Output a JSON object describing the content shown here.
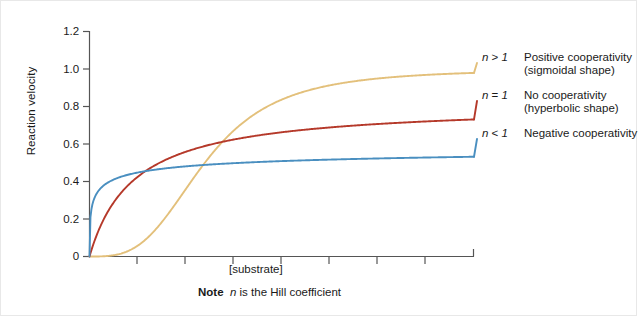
{
  "chart_data": {
    "type": "line",
    "title": "",
    "xlabel": "[substrate]",
    "ylabel": "Reaction velocity",
    "ylim": [
      0,
      1.2
    ],
    "xlim": [
      0,
      1
    ],
    "yticks": [
      "0",
      "0.2",
      "0.4",
      "0.6",
      "0.8",
      "1.0",
      "1.2"
    ],
    "ytick_values": [
      0,
      0.2,
      0.4,
      0.6,
      0.8,
      1.0,
      1.2
    ],
    "xticks": [
      "",
      "",
      "",
      "",
      "",
      "",
      "",
      ""
    ],
    "grid": false,
    "legend_position": "right-inline-annotations",
    "note": "Note n is the Hill coefficient",
    "note_bold": "Note",
    "note_italic": "n",
    "note_rest": " is the Hill coefficient",
    "series": [
      {
        "name": "n > 1",
        "label": "Positive cooperativity",
        "sublabel": "(sigmoidal shape)",
        "color": "#e3c07b",
        "vmax": 1.0,
        "hill_n": 3.2,
        "k_half": 0.3,
        "x": [
          0.0,
          0.05,
          0.1,
          0.15,
          0.2,
          0.25,
          0.3,
          0.35,
          0.4,
          0.45,
          0.5,
          0.55,
          0.6,
          0.65,
          0.7,
          0.75,
          0.8,
          0.85,
          0.9,
          0.95,
          1.0
        ],
        "y": [
          0.0,
          0.005,
          0.035,
          0.104,
          0.216,
          0.36,
          0.5,
          0.625,
          0.722,
          0.793,
          0.845,
          0.882,
          0.909,
          0.928,
          0.943,
          0.954,
          0.962,
          0.969,
          0.974,
          0.978,
          0.981
        ]
      },
      {
        "name": "n = 1",
        "label": "No cooperativity",
        "sublabel": "(hyperbolic shape)",
        "color": "#b5392a",
        "vmax": 0.815,
        "hill_n": 1.0,
        "k_half": 0.115,
        "x": [
          0.0,
          0.05,
          0.1,
          0.15,
          0.2,
          0.25,
          0.3,
          0.35,
          0.4,
          0.45,
          0.5,
          0.55,
          0.6,
          0.65,
          0.7,
          0.75,
          0.8,
          0.85,
          0.9,
          0.95,
          1.0
        ],
        "y": [
          0.0,
          0.247,
          0.379,
          0.46,
          0.517,
          0.558,
          0.589,
          0.614,
          0.633,
          0.649,
          0.663,
          0.674,
          0.684,
          0.692,
          0.7,
          0.706,
          0.712,
          0.717,
          0.722,
          0.726,
          0.73
        ]
      },
      {
        "name": "n < 1",
        "label": "Negative cooperativity",
        "sublabel": "",
        "color": "#4a8fc0",
        "vmax": 0.615,
        "hill_n": 0.42,
        "k_half": 0.012,
        "x": [
          0.0,
          0.05,
          0.1,
          0.15,
          0.2,
          0.25,
          0.3,
          0.35,
          0.4,
          0.45,
          0.5,
          0.55,
          0.6,
          0.65,
          0.7,
          0.75,
          0.8,
          0.85,
          0.9,
          0.95,
          1.0
        ],
        "y": [
          0.0,
          0.428,
          0.462,
          0.481,
          0.494,
          0.504,
          0.512,
          0.518,
          0.524,
          0.529,
          0.533,
          0.537,
          0.54,
          0.544,
          0.546,
          0.549,
          0.552,
          0.554,
          0.556,
          0.558,
          0.56
        ]
      }
    ],
    "annotations": [
      {
        "n": "n > 1",
        "text": "Positive cooperativity",
        "sub": "(sigmoidal shape)"
      },
      {
        "n": "n = 1",
        "text": "No cooperativity",
        "sub": "(hyperbolic shape)"
      },
      {
        "n": "n < 1",
        "text": "Negative cooperativity",
        "sub": ""
      }
    ],
    "axis_color": "#555555"
  }
}
